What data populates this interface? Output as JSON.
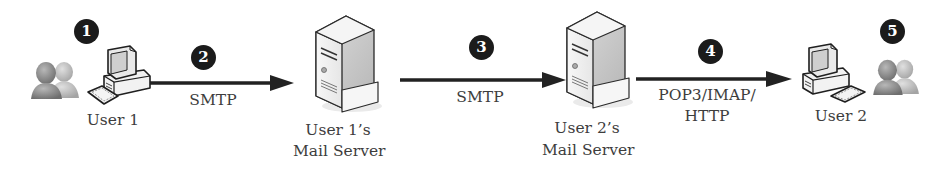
{
  "diagram": {
    "title": "",
    "steps": [
      {
        "number": "1",
        "description": "User 1 composes email"
      },
      {
        "number": "2",
        "description": "Sent via SMTP to User 1's mail server"
      },
      {
        "number": "3",
        "description": "Relayed via SMTP to User 2's mail server"
      },
      {
        "number": "4",
        "description": "Retrieved via POP3/IMAP/HTTP"
      },
      {
        "number": "5",
        "description": "User 2 reads email"
      }
    ],
    "nodes": {
      "user1": {
        "label": "User 1",
        "icon": "desktop-computer-icon"
      },
      "server1": {
        "line1": "User 1’s",
        "line2": "Mail Server",
        "icon": "mail-server-icon"
      },
      "server2": {
        "line1": "User 2’s",
        "line2": "Mail Server",
        "icon": "mail-server-icon"
      },
      "user2": {
        "label": "User 2",
        "icon": "desktop-computer-icon"
      }
    },
    "edges": [
      {
        "from": "user1",
        "to": "server1",
        "protocol": "SMTP"
      },
      {
        "from": "server1",
        "to": "server2",
        "protocol": "SMTP"
      },
      {
        "from": "server2",
        "to": "user2",
        "protocol_line1": "POP3/IMAP/",
        "protocol_line2": "HTTP"
      }
    ],
    "colors": {
      "badge": "#1b1b1b",
      "arrow": "#222222",
      "text": "#3d3d3d"
    }
  }
}
